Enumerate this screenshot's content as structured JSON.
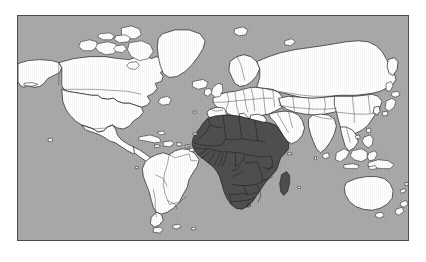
{
  "page": {
    "background_color": "#ffffff",
    "width": 426,
    "height": 262
  },
  "map": {
    "title": "World map with Africa highlighted",
    "projection": "mercator",
    "frame": {
      "x": 17,
      "y": 15,
      "width": 392,
      "height": 226,
      "border_color": "#4d4d4d"
    },
    "colors": {
      "ocean": "#a8a8a8",
      "land_default": "#ffffff",
      "land_highlight": "#4a4a4a",
      "coastline": "#1a1a1a",
      "country_border": "#333333",
      "country_border_highlight": "#111111",
      "frame_border": "#4d4d4d"
    },
    "legend": {
      "highlighted_label": "Africa",
      "default_label": "Rest of world"
    },
    "highlighted_regions": [
      "Africa",
      "Madagascar"
    ],
    "highlighted_countries": [
      "Morocco",
      "Western Sahara",
      "Algeria",
      "Tunisia",
      "Libya",
      "Egypt",
      "Mauritania",
      "Mali",
      "Niger",
      "Chad",
      "Sudan",
      "Eritrea",
      "Djibouti",
      "Ethiopia",
      "Somalia",
      "Senegal",
      "Gambia",
      "Guinea-Bissau",
      "Guinea",
      "Sierra Leone",
      "Liberia",
      "Ivory Coast",
      "Burkina Faso",
      "Ghana",
      "Togo",
      "Benin",
      "Nigeria",
      "Cameroon",
      "Central African Republic",
      "Equatorial Guinea",
      "Gabon",
      "Republic of the Congo",
      "Democratic Republic of the Congo",
      "Uganda",
      "Kenya",
      "Rwanda",
      "Burundi",
      "Tanzania",
      "Angola",
      "Zambia",
      "Malawi",
      "Mozambique",
      "Zimbabwe",
      "Botswana",
      "Namibia",
      "South Africa",
      "Lesotho",
      "Eswatini",
      "Madagascar"
    ],
    "unhighlighted_regions": [
      "North America",
      "South America",
      "Greenland",
      "Europe",
      "Asia",
      "Australia",
      "New Zealand",
      "Japan",
      "Indonesia",
      "Philippines",
      "Arabian Peninsula",
      "Iceland",
      "British Isles"
    ]
  }
}
